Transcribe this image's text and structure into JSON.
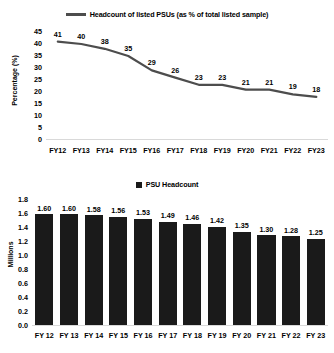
{
  "figure": {
    "background": "#ffffff",
    "line_color": "#4d4d4d",
    "bar_color": "#1a1a1a",
    "axis_color": "#d9d9d9",
    "clipped_top_text": ""
  },
  "chart_data": [
    {
      "type": "line",
      "title": "",
      "legend": "Headcount of listed PSUs (as % of total listed sample)",
      "legend_position": "top-center",
      "xlabel": "",
      "ylabel": "Percentage (%)",
      "categories": [
        "FY12",
        "FY13",
        "FY14",
        "FY15",
        "FY16",
        "FY17",
        "FY18",
        "FY19",
        "FY20",
        "FY21",
        "FY22",
        "FY23"
      ],
      "values": [
        41,
        40,
        38,
        35,
        29,
        26,
        23,
        23,
        21,
        21,
        19,
        18
      ],
      "data_labels": [
        "41",
        "40",
        "38",
        "35",
        "29",
        "26",
        "23",
        "23",
        "21",
        "21",
        "19",
        "18"
      ],
      "ylim": [
        0,
        45
      ],
      "yticks": [
        45,
        40,
        35,
        30,
        25,
        20,
        15,
        10,
        5,
        0
      ],
      "ytick_labels": [
        "45",
        "40",
        "35",
        "30",
        "25",
        "20",
        "15",
        "10",
        "5",
        "0"
      ],
      "grid": false
    },
    {
      "type": "bar",
      "title": "",
      "legend": "PSU Headcount",
      "legend_position": "top-center",
      "xlabel": "",
      "ylabel": "Millions",
      "categories": [
        "FY 12",
        "FY 13",
        "FY 14",
        "FY 15",
        "FY 16",
        "FY 17",
        "FY 18",
        "FY 19",
        "FY 20",
        "FY 21",
        "FY 22",
        "FY 23"
      ],
      "values": [
        1.6,
        1.6,
        1.58,
        1.56,
        1.53,
        1.49,
        1.46,
        1.42,
        1.35,
        1.3,
        1.28,
        1.25
      ],
      "data_labels": [
        "1.60",
        "1.60",
        "1.58",
        "1.56",
        "1.53",
        "1.49",
        "1.46",
        "1.42",
        "1.35",
        "1.30",
        "1.28",
        "1.25"
      ],
      "ylim": [
        0,
        1.8
      ],
      "yticks": [
        1.8,
        1.6,
        1.4,
        1.2,
        1.0,
        0.8,
        0.6,
        0.4,
        0.2,
        0.0
      ],
      "ytick_labels": [
        "1.8",
        "1.6",
        "1.4",
        "1.2",
        "1.0",
        "0.8",
        "0.6",
        "0.4",
        "0.2",
        "0.0"
      ],
      "grid": false
    }
  ]
}
